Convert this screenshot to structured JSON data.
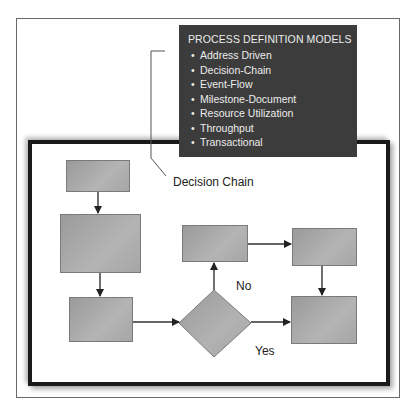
{
  "legend": {
    "title": "PROCESS DEFINITION MODELS",
    "items": [
      "Address Driven",
      "Decision-Chain",
      "Event-Flow",
      "Milestone-Document",
      "Resource Utilization",
      "Throughput",
      "Transactional"
    ]
  },
  "diagram": {
    "callout_label": "Decision Chain",
    "decision_no_label": "No",
    "decision_yes_label": "Yes"
  },
  "colors": {
    "legend_bg": "#3c3c3c",
    "shape_fill": "#a8a8a8",
    "frame": "#1a1a1a"
  }
}
